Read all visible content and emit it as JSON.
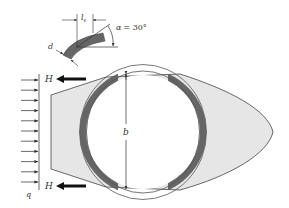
{
  "labels": {
    "force_top": "H",
    "force_bottom": "H",
    "load": "q",
    "diameter": "b",
    "thickness": "d",
    "length": "l",
    "length_sub": "s",
    "angle_symbol": "α",
    "angle_value": "= 30°"
  },
  "colors": {
    "fluid_fill": "#e6e6e6",
    "band_fill": "#666666",
    "stroke": "#333333",
    "ring_stroke": "#555555"
  },
  "load_arrows": {
    "count": 11,
    "y_start": 80,
    "spacing": 10.2
  }
}
